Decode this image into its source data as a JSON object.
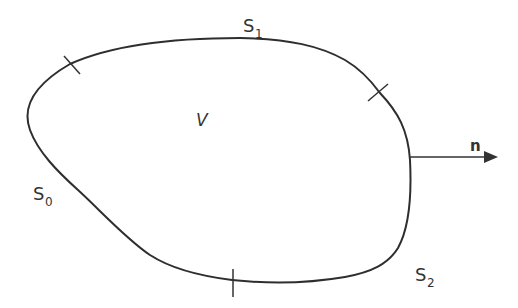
{
  "diagram": {
    "title": "",
    "region_label": "V",
    "surfaces": [
      {
        "name": "S",
        "subscript": "0"
      },
      {
        "name": "S",
        "subscript": "1"
      },
      {
        "name": "S",
        "subscript": "2"
      }
    ],
    "normal_vector_label": "n",
    "colors": {
      "stroke": "#2e2e2e",
      "text": "#333333",
      "background": "#ffffff"
    },
    "boundary_dividers": 3
  }
}
